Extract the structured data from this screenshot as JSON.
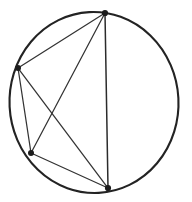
{
  "figure": {
    "caption": "",
    "background_color": "#ffffff",
    "line_color": "#2b2b2b",
    "circle_color": "#232323",
    "vertex_color": "#1c1c1c",
    "canvas": {
      "width": 192,
      "height": 202
    },
    "circle": {
      "cx": 94,
      "cy": 102.5,
      "rx": 84.5,
      "ry": 90.5,
      "rotation": -3
    },
    "vertices": [
      {
        "id": "A",
        "label": "",
        "x": 105,
        "y": 13,
        "role": "top"
      },
      {
        "id": "B",
        "label": "",
        "x": 18,
        "y": 68,
        "role": "left"
      },
      {
        "id": "C",
        "label": "",
        "x": 31,
        "y": 153,
        "role": "lower-left"
      },
      {
        "id": "D",
        "label": "",
        "x": 108,
        "y": 188,
        "role": "bottom"
      }
    ],
    "chords": [
      {
        "id": "AB",
        "from": "A",
        "to": "B",
        "kind": "side",
        "weight": "thin"
      },
      {
        "id": "BC",
        "from": "B",
        "to": "C",
        "kind": "side",
        "weight": "thin"
      },
      {
        "id": "CD",
        "from": "C",
        "to": "D",
        "kind": "side",
        "weight": "thin"
      },
      {
        "id": "DA",
        "from": "D",
        "to": "A",
        "kind": "side",
        "weight": "normal"
      },
      {
        "id": "AC",
        "from": "A",
        "to": "C",
        "kind": "diagonal",
        "weight": "thin"
      },
      {
        "id": "BD",
        "from": "B",
        "to": "D",
        "kind": "diagonal",
        "weight": "thin"
      }
    ],
    "intersection": {
      "id": "P",
      "label": "",
      "x": 63,
      "y": 112
    }
  }
}
